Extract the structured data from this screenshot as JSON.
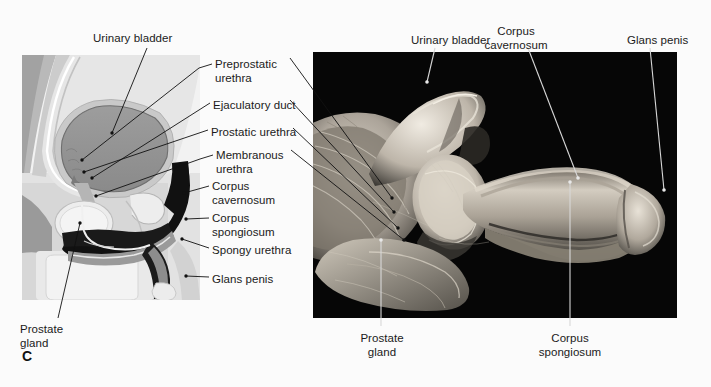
{
  "figure": {
    "panel_letter": "C",
    "background_color": "#fbfbfb",
    "ink_color": "#1a1a1a"
  },
  "diagram_panel": {
    "name": "sagittal-line-drawing",
    "x": 22,
    "y": 55,
    "width": 178,
    "height": 245,
    "description": "Grayscale midsagittal line drawing of male pelvis"
  },
  "photo_panel": {
    "name": "cadaver-photograph",
    "x": 313,
    "y": 52,
    "width": 364,
    "height": 266,
    "background_color": "#050505",
    "description": "Black-background dissection photograph of male urethra and penis"
  },
  "labels": {
    "diagram_top": {
      "text": "Urinary bladder",
      "x": 93,
      "y": 32,
      "align": "left"
    },
    "center_column": [
      {
        "id": "preprostatic-urethra",
        "lines": "Preprostatic\nurethra",
        "x": 215,
        "y": 58,
        "align": "left"
      },
      {
        "id": "ejaculatory-duct",
        "lines": "Ejaculatory duct",
        "x": 213,
        "y": 99,
        "align": "left"
      },
      {
        "id": "prostatic-urethra",
        "lines": "Prostatic urethra",
        "x": 211,
        "y": 126,
        "align": "left"
      },
      {
        "id": "membranous-urethra",
        "lines": "Membranous\nurethra",
        "x": 216,
        "y": 149,
        "align": "left"
      },
      {
        "id": "corpus-cavernosum",
        "lines": "Corpus\ncavernosum",
        "x": 212,
        "y": 180,
        "align": "left"
      },
      {
        "id": "corpus-spongiosum",
        "lines": "Corpus\nspongiosum",
        "x": 212,
        "y": 212,
        "align": "left"
      },
      {
        "id": "spongy-urethra",
        "lines": "Spongy urethra",
        "x": 212,
        "y": 244,
        "align": "left"
      },
      {
        "id": "glans-penis",
        "lines": "Glans penis",
        "x": 212,
        "y": 273,
        "align": "left"
      }
    ],
    "diagram_bottom": {
      "text": "Prostate\ngland",
      "x": 20,
      "y": 323,
      "align": "left"
    },
    "photo_top": [
      {
        "id": "urinary-bladder",
        "lines": "Urinary bladder",
        "x": 411,
        "y": 34,
        "align": "left"
      },
      {
        "id": "corpus-cavernosum",
        "lines": "Corpus\ncavernosum",
        "x": 516,
        "y": 25,
        "align": "center"
      },
      {
        "id": "glans-penis",
        "lines": "Glans penis",
        "x": 627,
        "y": 34,
        "align": "left"
      }
    ],
    "photo_bottom": [
      {
        "id": "prostate-gland",
        "lines": "Prostate\ngland",
        "x": 358,
        "y": 332,
        "align": "left"
      },
      {
        "id": "corpus-spongiosum",
        "lines": "Corpus\nspongiosum",
        "x": 552,
        "y": 332,
        "align": "center"
      }
    ]
  }
}
